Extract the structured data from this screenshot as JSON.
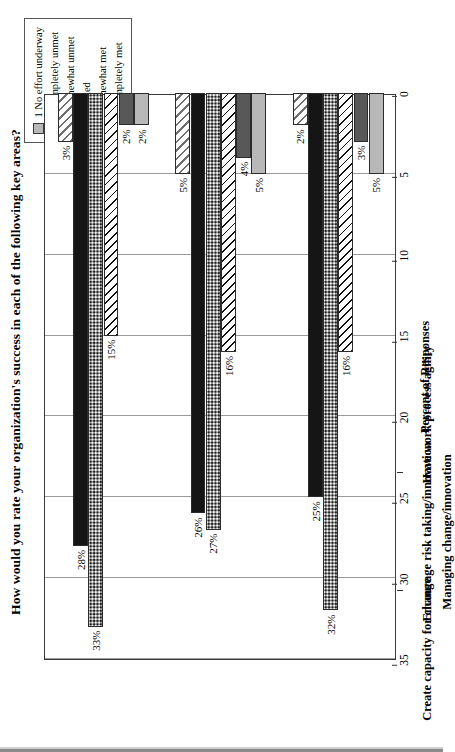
{
  "chart_data": {
    "type": "bar",
    "title": "How would you rate your organization's success in each of the following key areas?",
    "xlabel": "",
    "ylabel": "Percent of Responses",
    "ylim": [
      0,
      35
    ],
    "yticks": [
      "0",
      "5",
      "10",
      "15",
      "20",
      "25",
      "30",
      "35"
    ],
    "grid": true,
    "legend_position": "top-right",
    "orientation": "vertical-bars-page-rotated-90",
    "categories": [
      "Have work process agility",
      "Encourage risk taking/innovation",
      "Create capacity for change"
    ],
    "group_label": "Managing change/innovation",
    "series": [
      {
        "name": "1 No effort underway",
        "values": [
          5,
          5,
          2
        ],
        "labels": [
          "5%",
          "5%",
          "2%"
        ]
      },
      {
        "name": "2 Completely unmet",
        "values": [
          3,
          4,
          2
        ],
        "labels": [
          "3%",
          "4%",
          "2%"
        ]
      },
      {
        "name": "3 Somewhat unmet",
        "values": [
          16,
          16,
          15
        ],
        "labels": [
          "16%",
          "16%",
          "15%"
        ]
      },
      {
        "name": "4 Mixed",
        "values": [
          32,
          27,
          33
        ],
        "labels": [
          "32%",
          "27%",
          "33%"
        ]
      },
      {
        "name": "5 Somewhat met",
        "values": [
          25,
          26,
          28
        ],
        "labels": [
          "25%",
          "26%",
          "28%"
        ]
      },
      {
        "name": "6 Completely met",
        "values": [
          2,
          5,
          3
        ],
        "labels": [
          "2%",
          "5%",
          "3%"
        ]
      }
    ]
  },
  "legend": {
    "items": [
      {
        "label": "1  No effort underway",
        "swatch": "light-gray-solid"
      },
      {
        "label": "2  Completely unmet",
        "swatch": "dark-gray-solid"
      },
      {
        "label": "3  Somewhat unmet",
        "swatch": "white-black-diagonal-hatch"
      },
      {
        "label": "4  Mixed",
        "swatch": "speckled-stipple"
      },
      {
        "label": "5  Somewhat met",
        "swatch": "black-solid"
      },
      {
        "label": "6  Completely met",
        "swatch": "white-gray-diagonal-hatch"
      }
    ]
  },
  "colors": {
    "series_1": "#b8b8b8",
    "series_2": "#585858",
    "series_3": "#ffffff",
    "series_4": "#909090",
    "series_5": "#151515",
    "series_6": "#ffffff",
    "axis": "#3b3b3b",
    "grid": "#9a9a9a"
  }
}
